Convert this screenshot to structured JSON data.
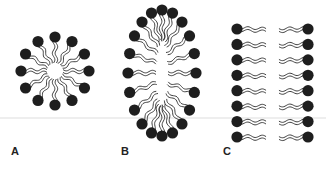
{
  "figure": {
    "panels": [
      {
        "label": "A",
        "structure": "micelle",
        "heads": 12,
        "center": [
          55,
          71
        ],
        "radius": 34
      },
      {
        "label": "B",
        "structure": "elongated micelle",
        "heads": 20,
        "center": [
          162,
          73
        ],
        "rx": 34,
        "ry": 63
      },
      {
        "label": "C",
        "structure": "bilayer",
        "rows": 8,
        "left_x": 237,
        "right_x": 308,
        "y_start": 29,
        "y_end": 137
      }
    ],
    "colors": {
      "head": "#1e1e1e",
      "tail": "#2a2a2a",
      "background": "#ffffff",
      "divider": "#dddddd"
    }
  }
}
